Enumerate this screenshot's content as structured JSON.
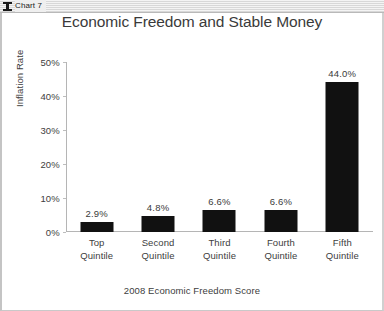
{
  "window": {
    "title": "Chart 7",
    "icon": "chart-window-icon"
  },
  "chart_data": {
    "type": "bar",
    "title": "Economic Freedom and Stable Money",
    "xlabel": "2008 Economic Freedom Score",
    "ylabel": "Inflation Rate",
    "categories": [
      "Top Quintile",
      "Second Quintile",
      "Third Quintile",
      "Fourth Quintile",
      "Fifth Quintile"
    ],
    "category_lines": [
      [
        "Top",
        "Quintile"
      ],
      [
        "Second",
        "Quintile"
      ],
      [
        "Third",
        "Quintile"
      ],
      [
        "Fourth",
        "Quintile"
      ],
      [
        "Fifth",
        "Quintile"
      ]
    ],
    "values": [
      2.9,
      4.8,
      6.6,
      6.6,
      44.0
    ],
    "value_labels": [
      "2.9%",
      "4.8%",
      "6.6%",
      "6.6%",
      "44.0%"
    ],
    "ylim": [
      0,
      50
    ],
    "ytick_values": [
      0,
      10,
      20,
      30,
      40,
      50
    ],
    "ytick_labels": [
      "0%",
      "10%",
      "20%",
      "30%",
      "40%",
      "50%"
    ],
    "grid": false,
    "legend": null,
    "bar_color": "#111111",
    "axis_color": "#b5b5b5",
    "text_color": "#3d3d3d"
  }
}
